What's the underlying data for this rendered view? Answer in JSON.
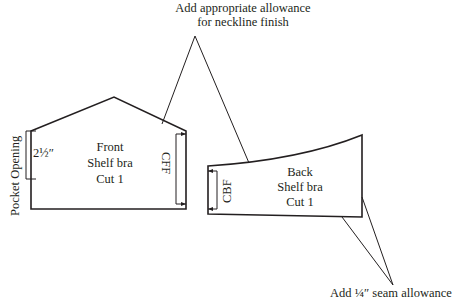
{
  "callouts": {
    "neckline": {
      "line1": "Add appropriate allowance",
      "line2": "for neckline finish"
    },
    "seam": "Add ¼″ seam allowance"
  },
  "front_piece": {
    "line1": "Front",
    "line2": "Shelf bra",
    "line3": "Cut 1",
    "fold_label": "CFF",
    "pocket_label": "Pocket Opening",
    "pocket_measure": "2½″"
  },
  "back_piece": {
    "line1": "Back",
    "line2": "Shelf bra",
    "line3": "Cut 1",
    "fold_label": "CBF"
  },
  "colors": {
    "stroke": "#231f20",
    "background": "#ffffff"
  }
}
